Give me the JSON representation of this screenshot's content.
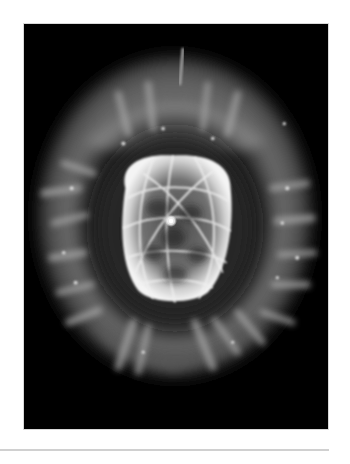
{
  "figure": {
    "alt": "Grayscale telescope photograph of a planetary nebula: a bright, bubble-like inner shell with a central star, surrounded by a dimmer, filamentary outer halo on a black background",
    "subject": "planetary nebula",
    "colors": {
      "background": "#000000",
      "halo": "#bdbdbd",
      "shell": "#f2f2f2",
      "star": "#ffffff",
      "page": "#ffffff",
      "divider": "#d0d0d0"
    }
  }
}
